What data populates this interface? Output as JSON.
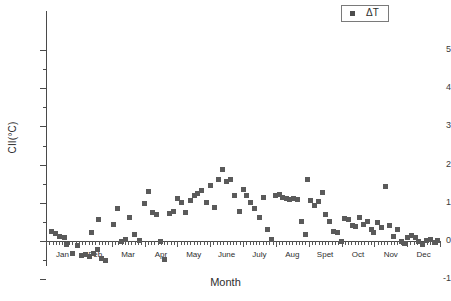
{
  "chart_data": {
    "type": "scatter",
    "title": "",
    "xlabel": "Month",
    "ylabel": "CII(°C)",
    "ylim": [
      -1,
      5
    ],
    "xlim": [
      0,
      12
    ],
    "grid": false,
    "legend_position": "top-right",
    "y_ticks_major": [
      -1,
      0,
      1,
      2,
      3,
      4,
      5
    ],
    "y_ticks_minor": [
      -0.5,
      0.5,
      1.5,
      2.5,
      3.5,
      4.5
    ],
    "x_tick_labels": [
      "Jan",
      "Feb",
      "Mar",
      "Apr",
      "May",
      "June",
      "July",
      "Aug",
      "Spet",
      "Oct",
      "Nov",
      "Dec"
    ],
    "series": [
      {
        "name": "ΔT",
        "marker": "square",
        "color": "#5a5a5a",
        "points": [
          [
            0.18,
            0.26
          ],
          [
            0.3,
            0.2
          ],
          [
            0.42,
            0.13
          ],
          [
            0.55,
            0.09
          ],
          [
            0.62,
            -0.1
          ],
          [
            0.8,
            -0.32
          ],
          [
            0.95,
            -0.12
          ],
          [
            1.08,
            -0.38
          ],
          [
            1.2,
            -0.36
          ],
          [
            1.32,
            -0.4
          ],
          [
            1.45,
            -0.34
          ],
          [
            1.58,
            -0.22
          ],
          [
            1.7,
            -0.46
          ],
          [
            1.82,
            -0.5
          ],
          [
            1.38,
            0.22
          ],
          [
            1.6,
            0.55
          ],
          [
            2.05,
            0.42
          ],
          [
            2.18,
            0.84
          ],
          [
            2.3,
            -0.02
          ],
          [
            2.42,
            0.05
          ],
          [
            2.55,
            0.62
          ],
          [
            2.7,
            0.18
          ],
          [
            2.86,
            0.02
          ],
          [
            3.0,
            0.97
          ],
          [
            3.12,
            1.3
          ],
          [
            3.25,
            0.75
          ],
          [
            3.38,
            0.7
          ],
          [
            3.5,
            -0.02
          ],
          [
            3.62,
            -0.48
          ],
          [
            3.75,
            0.72
          ],
          [
            3.88,
            0.77
          ],
          [
            4.0,
            1.12
          ],
          [
            4.12,
            1.0
          ],
          [
            4.25,
            0.74
          ],
          [
            4.4,
            1.05
          ],
          [
            4.52,
            1.18
          ],
          [
            4.62,
            1.24
          ],
          [
            4.75,
            1.33
          ],
          [
            4.88,
            1.02
          ],
          [
            5.0,
            1.44
          ],
          [
            5.12,
            0.88
          ],
          [
            5.25,
            1.62
          ],
          [
            5.38,
            1.86
          ],
          [
            5.5,
            1.55
          ],
          [
            5.62,
            1.6
          ],
          [
            5.75,
            1.2
          ],
          [
            5.88,
            0.78
          ],
          [
            6.0,
            1.35
          ],
          [
            6.12,
            1.18
          ],
          [
            6.22,
            1.02
          ],
          [
            6.35,
            0.86
          ],
          [
            6.5,
            0.62
          ],
          [
            6.62,
            1.14
          ],
          [
            6.75,
            0.3
          ],
          [
            6.88,
            0.05
          ],
          [
            7.0,
            1.2
          ],
          [
            7.1,
            1.22
          ],
          [
            7.2,
            1.13
          ],
          [
            7.32,
            1.11
          ],
          [
            7.42,
            1.09
          ],
          [
            7.55,
            1.1
          ],
          [
            7.66,
            1.08
          ],
          [
            7.78,
            0.52
          ],
          [
            7.9,
            0.18
          ],
          [
            7.95,
            1.62
          ],
          [
            8.05,
            1.05
          ],
          [
            8.18,
            0.92
          ],
          [
            8.3,
            1.03
          ],
          [
            8.42,
            1.26
          ],
          [
            8.52,
            0.7
          ],
          [
            8.64,
            0.5
          ],
          [
            8.76,
            0.26
          ],
          [
            8.88,
            0.22
          ],
          [
            9.0,
            -0.02
          ],
          [
            9.1,
            0.6
          ],
          [
            9.22,
            0.56
          ],
          [
            9.32,
            0.4
          ],
          [
            9.44,
            0.38
          ],
          [
            9.55,
            0.62
          ],
          [
            9.66,
            0.44
          ],
          [
            9.78,
            0.52
          ],
          [
            9.9,
            0.3
          ],
          [
            9.98,
            0.22
          ],
          [
            10.1,
            0.48
          ],
          [
            10.22,
            0.36
          ],
          [
            10.34,
            1.42
          ],
          [
            10.46,
            0.4
          ],
          [
            10.58,
            0.12
          ],
          [
            10.7,
            0.3
          ],
          [
            10.82,
            0.0
          ],
          [
            10.92,
            -0.06
          ],
          [
            11.02,
            0.1
          ],
          [
            11.14,
            0.14
          ],
          [
            11.26,
            0.08
          ],
          [
            11.36,
            -0.02
          ],
          [
            11.46,
            -0.1
          ],
          [
            11.58,
            0.02
          ],
          [
            11.7,
            0.05
          ],
          [
            11.82,
            -0.04
          ],
          [
            11.92,
            0.01
          ]
        ]
      }
    ]
  },
  "legend": {
    "label": "ΔT"
  },
  "axes": {
    "y_title": "CII(°C)",
    "x_title": "Month"
  },
  "colors": {
    "marker": "#5a5a5a",
    "axis": "#4a4a4a",
    "text": "#2e2e2e"
  }
}
